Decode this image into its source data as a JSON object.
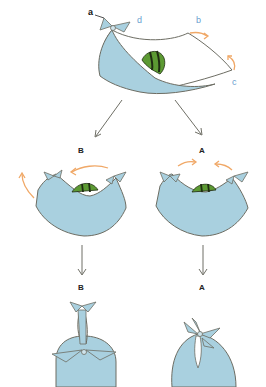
{
  "diagram": {
    "colors": {
      "fabric": "#a9d0df",
      "outline": "#6d6d63",
      "arrow_orange": "#f0a867",
      "arrow_gray": "#6f6f66",
      "melon_green": "#5c9a33",
      "melon_stripe": "#1f2d12",
      "corner_label_blue": "#6aa0cf"
    },
    "top_step": {
      "corner_labels": {
        "a": "a",
        "b": "b",
        "c": "c",
        "d": "d"
      }
    },
    "branches": [
      {
        "id": "B",
        "label": "B",
        "middle_label": "B"
      },
      {
        "id": "A",
        "label": "A",
        "middle_label": "A"
      }
    ]
  }
}
